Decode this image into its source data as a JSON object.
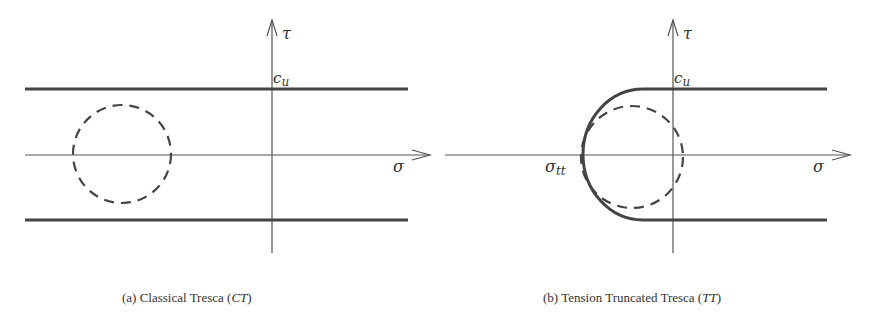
{
  "figure": {
    "panels": [
      {
        "id": "a",
        "caption_prefix": "(a) Classical Tresca (",
        "caption_abbrev": "CT",
        "caption_suffix": ")",
        "labels": {
          "tau": "τ",
          "sigma": "σ",
          "cu": "c",
          "cu_sub": "u"
        }
      },
      {
        "id": "b",
        "caption_prefix": "(b) Tension Truncated Tresca (",
        "caption_abbrev": "TT",
        "caption_suffix": ")",
        "labels": {
          "tau": "τ",
          "sigma": "σ",
          "cu": "c",
          "cu_sub": "u",
          "sigma_tt": "σ",
          "sigma_tt_sub": "tt"
        }
      }
    ],
    "colors": {
      "line": "#444444",
      "axis": "#555555"
    }
  }
}
